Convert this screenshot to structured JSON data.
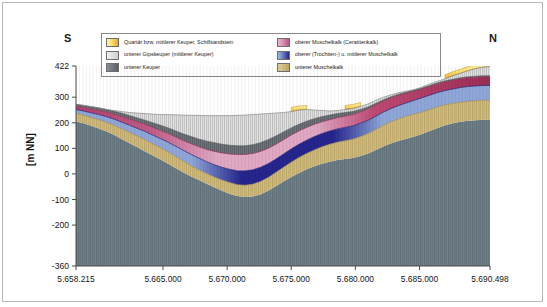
{
  "figure": {
    "direction_start": "S",
    "direction_end": "N",
    "y_axis_title": "[m NN]",
    "accent_colors": {
      "quartaer_keuper_schilfsandstein": "#f5c842",
      "unterer_gipskeuper": "#dcdcdc",
      "unterer_keuper": "#6e7479",
      "oberer_muschelkalk_ceratitenkalk": "#b9467a",
      "oberer_trochiten_mittlerer_muschelkalk": "#2b2b8f",
      "unterer_muschelkalk": "#cdb978",
      "basement_grey_blue": "#6f8189"
    }
  },
  "legend": {
    "items_left": [
      {
        "label": "Quartär bzw. mittlerer Keuper, Schilfsandstein",
        "swatch": "gradient-yellow-orange"
      },
      {
        "label": "unterer Gipskeuper (mittlerer Keuper)",
        "swatch": "light-grey"
      },
      {
        "label": "unterer Keuper",
        "swatch": "dark-grey"
      }
    ],
    "items_right": [
      {
        "label": "oberer Muschelkalk (Ceratitenkalk)",
        "swatch": "gradient-pink-mauve"
      },
      {
        "label": "oberer (Trochiten-) u. mittlerer Muschelkalk",
        "swatch": "gradient-blue-darkblue"
      },
      {
        "label": "unterer Muschelkalk",
        "swatch": "tan"
      }
    ]
  },
  "chart_data": {
    "type": "area",
    "title": "",
    "subtitle": "",
    "xlabel": "",
    "ylabel": "[m NN]",
    "grid": false,
    "legend_position": "top-center",
    "xlim": [
      5658215,
      5690498
    ],
    "ylim": [
      -360,
      422
    ],
    "x_tick_labels": [
      "5.658.215",
      "5.665.000",
      "5.670.000",
      "5.675.000",
      "5.680.000",
      "5.685.000",
      "5.690.498"
    ],
    "x_ticks": [
      5658215,
      5665000,
      5670000,
      5675000,
      5680000,
      5685000,
      5690498
    ],
    "y_tick_labels": [
      "422",
      "300",
      "200",
      "100",
      "0",
      "-100",
      "-200",
      "-360"
    ],
    "y_ticks": [
      422,
      300,
      200,
      100,
      0,
      -100,
      -200,
      -360
    ],
    "x": [
      5658215,
      5658800,
      5659400,
      5660000,
      5660600,
      5661200,
      5661800,
      5662400,
      5663000,
      5663600,
      5664200,
      5664800,
      5665400,
      5666000,
      5666600,
      5667200,
      5667800,
      5668400,
      5669000,
      5669600,
      5670200,
      5670800,
      5671400,
      5672000,
      5672600,
      5673200,
      5673800,
      5674400,
      5675000,
      5675600,
      5676200,
      5676800,
      5677400,
      5678000,
      5678600,
      5679200,
      5679800,
      5680400,
      5681000,
      5681600,
      5682200,
      5682800,
      5683400,
      5684000,
      5684600,
      5685200,
      5685800,
      5686400,
      5687000,
      5687600,
      5688200,
      5688800,
      5689400,
      5690000,
      5690498
    ],
    "series": [
      {
        "name": "unterer Muschelkalk",
        "note": "base of coloured sequence; top of grey-blue basement",
        "values": [
          205,
          198,
          188,
          178,
          166,
          152,
          136,
          120,
          104,
          88,
          72,
          56,
          40,
          22,
          6,
          -10,
          -24,
          -38,
          -52,
          -66,
          -78,
          -86,
          -90,
          -88,
          -80,
          -66,
          -48,
          -30,
          -12,
          4,
          18,
          30,
          40,
          48,
          54,
          58,
          62,
          70,
          80,
          94,
          108,
          120,
          130,
          138,
          146,
          156,
          168,
          180,
          190,
          198,
          204,
          208,
          210,
          212,
          212
        ]
      },
      {
        "name": "oberer (Trochiten-) u. mittlerer Muschelkalk",
        "note": "top of unterer Muschelkalk / base of mittlerer Muschelkalk",
        "values": [
          237,
          230,
          221,
          212,
          202,
          190,
          176,
          162,
          148,
          134,
          118,
          102,
          86,
          68,
          50,
          32,
          16,
          2,
          -12,
          -24,
          -34,
          -42,
          -44,
          -40,
          -30,
          -14,
          6,
          26,
          46,
          64,
          80,
          94,
          106,
          116,
          124,
          130,
          136,
          146,
          158,
          174,
          190,
          204,
          216,
          226,
          234,
          242,
          252,
          262,
          270,
          276,
          280,
          284,
          286,
          288,
          288
        ]
      },
      {
        "name": "oberer Muschelkalk (Ceratitenkalk)",
        "note": "top of blue unit",
        "values": [
          252,
          246,
          239,
          232,
          224,
          214,
          202,
          190,
          178,
          166,
          152,
          138,
          124,
          108,
          92,
          76,
          62,
          48,
          36,
          26,
          18,
          12,
          12,
          16,
          26,
          40,
          58,
          78,
          98,
          116,
          132,
          146,
          158,
          168,
          176,
          182,
          188,
          198,
          210,
          226,
          242,
          256,
          268,
          278,
          288,
          298,
          308,
          318,
          326,
          332,
          338,
          342,
          344,
          346,
          346
        ]
      },
      {
        "name": "unterer Keuper",
        "note": "top of Ceratitenkalk",
        "values": [
          265,
          260,
          254,
          248,
          242,
          234,
          224,
          214,
          204,
          194,
          182,
          170,
          158,
          144,
          130,
          118,
          106,
          96,
          88,
          82,
          78,
          76,
          76,
          80,
          88,
          100,
          116,
          134,
          152,
          168,
          182,
          194,
          204,
          212,
          220,
          226,
          232,
          242,
          254,
          270,
          286,
          298,
          308,
          316,
          324,
          332,
          342,
          352,
          360,
          366,
          372,
          376,
          378,
          380,
          380
        ]
      },
      {
        "name": "unterer Gipskeuper (mittlerer Keuper)",
        "note": "top of unterer Keuper (dark grey band)",
        "values": [
          272,
          268,
          263,
          258,
          252,
          245,
          237,
          228,
          219,
          210,
          200,
          190,
          180,
          168,
          156,
          146,
          136,
          128,
          122,
          116,
          112,
          110,
          110,
          114,
          122,
          134,
          148,
          164,
          180,
          194,
          206,
          216,
          224,
          230,
          236,
          240,
          244,
          252,
          262,
          276,
          290,
          302,
          312,
          320,
          328,
          336,
          346,
          356,
          364,
          370,
          376,
          380,
          382,
          384,
          384
        ]
      },
      {
        "name": "Quartär bzw. mittlerer Keuper, Schilfsandstein",
        "note": "ground surface / top of profile (light-grey Gipskeuper fill below)",
        "values": [
          272,
          268,
          263,
          258,
          252,
          248,
          244,
          240,
          238,
          236,
          234,
          232,
          232,
          231,
          230,
          229,
          229,
          228,
          228,
          228,
          228,
          229,
          230,
          232,
          234,
          236,
          238,
          240,
          244,
          250,
          252,
          250,
          248,
          246,
          248,
          252,
          256,
          264,
          274,
          288,
          300,
          310,
          318,
          324,
          330,
          340,
          352,
          362,
          372,
          384,
          394,
          404,
          412,
          418,
          420
        ]
      }
    ]
  }
}
